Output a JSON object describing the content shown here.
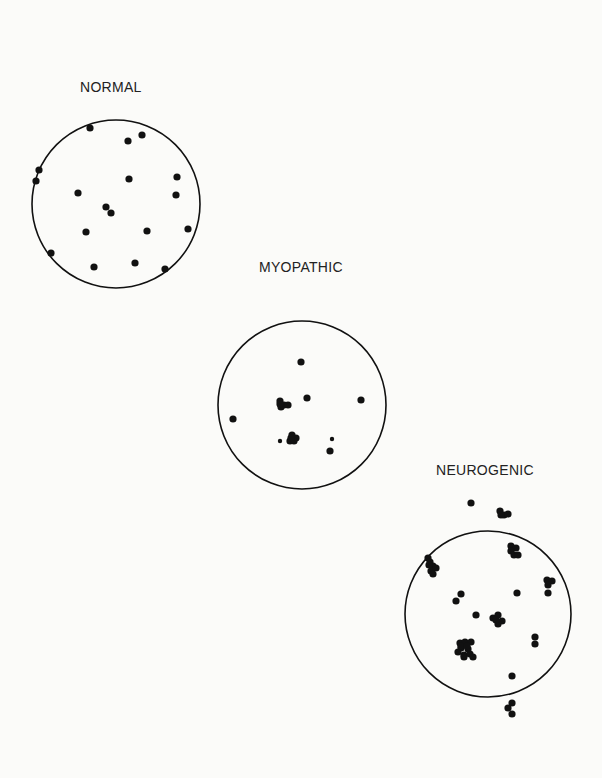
{
  "panels": [
    {
      "id": "normal",
      "label": "NORMAL",
      "label_pos": [
        80,
        92
      ],
      "circle": {
        "cx": 116,
        "cy": 204,
        "r": 84
      },
      "dots": [
        [
          90,
          128
        ],
        [
          128,
          141
        ],
        [
          142,
          135
        ],
        [
          39,
          170
        ],
        [
          36,
          181
        ],
        [
          129,
          179
        ],
        [
          177,
          177
        ],
        [
          176,
          195
        ],
        [
          78,
          193
        ],
        [
          106,
          207
        ],
        [
          111,
          213
        ],
        [
          86,
          232
        ],
        [
          147,
          231
        ],
        [
          188,
          229
        ],
        [
          51,
          253
        ],
        [
          94,
          267
        ],
        [
          135,
          263
        ],
        [
          165,
          269
        ]
      ]
    },
    {
      "id": "myopathic",
      "label": "MYOPATHIC",
      "label_pos": [
        259,
        272
      ],
      "circle": {
        "cx": 302,
        "cy": 405,
        "r": 84
      },
      "dots": [
        [
          301,
          362
        ],
        [
          307,
          398
        ],
        [
          361,
          400
        ],
        [
          233,
          419
        ],
        [
          280,
          401
        ],
        [
          284,
          405
        ],
        [
          288,
          405
        ],
        [
          281,
          407
        ],
        [
          280,
          404
        ],
        [
          292,
          435
        ],
        [
          296,
          438
        ],
        [
          290,
          441
        ],
        [
          294,
          441
        ],
        [
          291,
          438
        ],
        [
          330,
          451
        ]
      ],
      "small_dots": [
        [
          280,
          441
        ],
        [
          332,
          439
        ]
      ]
    },
    {
      "id": "neurogenic",
      "label": "NEUROGENIC",
      "label_pos": [
        436,
        475
      ],
      "circle": {
        "cx": 488,
        "cy": 614,
        "r": 83
      },
      "dots": [
        [
          471,
          503
        ],
        [
          500,
          511
        ],
        [
          504,
          515
        ],
        [
          508,
          514
        ],
        [
          501,
          515
        ],
        [
          511,
          546
        ],
        [
          516,
          548
        ],
        [
          514,
          555
        ],
        [
          518,
          555
        ],
        [
          511,
          551
        ],
        [
          428,
          558
        ],
        [
          430,
          562
        ],
        [
          433,
          566
        ],
        [
          431,
          571
        ],
        [
          436,
          568
        ],
        [
          429,
          565
        ],
        [
          433,
          574
        ],
        [
          547,
          580
        ],
        [
          552,
          581
        ],
        [
          548,
          585
        ],
        [
          548,
          593
        ],
        [
          461,
          594
        ],
        [
          456,
          601
        ],
        [
          517,
          593
        ],
        [
          476,
          615
        ],
        [
          493,
          618
        ],
        [
          498,
          615
        ],
        [
          502,
          621
        ],
        [
          498,
          624
        ],
        [
          496,
          620
        ],
        [
          460,
          643
        ],
        [
          465,
          642
        ],
        [
          471,
          642
        ],
        [
          461,
          648
        ],
        [
          468,
          649
        ],
        [
          458,
          652
        ],
        [
          464,
          655
        ],
        [
          470,
          654
        ],
        [
          473,
          657
        ],
        [
          464,
          657
        ],
        [
          461,
          646
        ],
        [
          467,
          646
        ],
        [
          535,
          637
        ],
        [
          535,
          644
        ],
        [
          512,
          676
        ],
        [
          512,
          703
        ],
        [
          508,
          708
        ],
        [
          512,
          714
        ]
      ]
    }
  ],
  "style": {
    "ink": "#111111",
    "paper": "#fbfbf9"
  }
}
